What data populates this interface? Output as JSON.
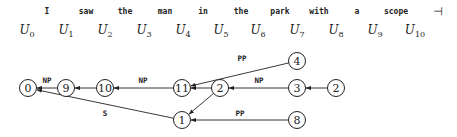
{
  "sentence": {
    "words": [
      {
        "text": "I",
        "x": 47
      },
      {
        "text": "saw",
        "x": 86
      },
      {
        "text": "the",
        "x": 125
      },
      {
        "text": "man",
        "x": 165
      },
      {
        "text": "in",
        "x": 203
      },
      {
        "text": "the",
        "x": 241
      },
      {
        "text": "park",
        "x": 280
      },
      {
        "text": "with",
        "x": 319
      },
      {
        "text": "a",
        "x": 357
      },
      {
        "text": "scope",
        "x": 396
      }
    ],
    "end_marker": "⊣",
    "end_marker_x": 438
  },
  "positions": [
    {
      "base": "U",
      "sub": "0",
      "x": 27
    },
    {
      "base": "U",
      "sub": "1",
      "x": 66
    },
    {
      "base": "U",
      "sub": "2",
      "x": 105
    },
    {
      "base": "U",
      "sub": "3",
      "x": 144
    },
    {
      "base": "U",
      "sub": "4",
      "x": 183
    },
    {
      "base": "U",
      "sub": "5",
      "x": 221
    },
    {
      "base": "U",
      "sub": "6",
      "x": 258
    },
    {
      "base": "U",
      "sub": "7",
      "x": 297
    },
    {
      "base": "U",
      "sub": "8",
      "x": 336
    },
    {
      "base": "U",
      "sub": "9",
      "x": 375
    },
    {
      "base": "U",
      "sub": "10",
      "x": 415
    }
  ],
  "graph": {
    "nodes": [
      {
        "id": "n0",
        "label": "0",
        "x": 28,
        "y": 88
      },
      {
        "id": "n9",
        "label": "9",
        "x": 66,
        "y": 88
      },
      {
        "id": "n10",
        "label": "10",
        "x": 105,
        "y": 88
      },
      {
        "id": "n11",
        "label": "11",
        "x": 182,
        "y": 88
      },
      {
        "id": "n2a",
        "label": "2",
        "x": 220,
        "y": 88
      },
      {
        "id": "n3",
        "label": "3",
        "x": 297,
        "y": 88
      },
      {
        "id": "n2b",
        "label": "2",
        "x": 336,
        "y": 88
      },
      {
        "id": "n4",
        "label": "4",
        "x": 297,
        "y": 61
      },
      {
        "id": "n1",
        "label": "1",
        "x": 182,
        "y": 120
      },
      {
        "id": "n8",
        "label": "8",
        "x": 297,
        "y": 120
      }
    ],
    "edges": [
      {
        "from": "n9",
        "to": "n0",
        "label": "NP",
        "lx": 47,
        "ly": 83
      },
      {
        "from": "n10",
        "to": "n9",
        "label": "",
        "lx": 0,
        "ly": 0
      },
      {
        "from": "n11",
        "to": "n10",
        "label": "NP",
        "lx": 143,
        "ly": 83
      },
      {
        "from": "n2a",
        "to": "n11",
        "label": "",
        "lx": 0,
        "ly": 0
      },
      {
        "from": "n3",
        "to": "n2a",
        "label": "NP",
        "lx": 259,
        "ly": 83
      },
      {
        "from": "n2b",
        "to": "n3",
        "label": "",
        "lx": 0,
        "ly": 0
      },
      {
        "from": "n4",
        "to": "n11",
        "label": "PP",
        "lx": 242,
        "ly": 61
      },
      {
        "from": "n2a",
        "to": "n1",
        "label": "",
        "lx": 0,
        "ly": 0
      },
      {
        "from": "n8",
        "to": "n1",
        "label": "PP",
        "lx": 240,
        "ly": 116
      },
      {
        "from": "n1",
        "to": "n0",
        "label": "S",
        "lx": 105,
        "ly": 116
      }
    ]
  }
}
